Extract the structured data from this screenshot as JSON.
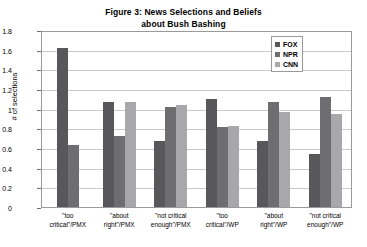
{
  "chart_data": {
    "type": "bar",
    "title": "Figure 3:  News Selections and Beliefs about Bush Bashing",
    "title_line1": "Figure 3:  News Selections and Beliefs",
    "title_line2": "about Bush Bashing",
    "xlabel": "",
    "ylabel": "# of selections",
    "ylim": [
      0,
      1.8
    ],
    "ytick_values": [
      "1.8",
      "1.6",
      "1.4",
      "1.2",
      "1",
      "0.8",
      "0.6",
      "0.4",
      "0.2",
      "0"
    ],
    "grid": true,
    "legend_position": "top-right",
    "categories": [
      "\"too critical\"/PMX",
      "\"about right\"/PMX",
      "\"not critical enough\"/PMX",
      "\"too critical\"/WP",
      "\"about right\"/WP",
      "\"not critical enough\"/WP"
    ],
    "category_lines": [
      [
        "\"too",
        "critical\"/PMX"
      ],
      [
        "\"about",
        "right\"/PMX"
      ],
      [
        "\"not critical",
        "enough\"/PMX"
      ],
      [
        "\"too",
        "critical\"/WP"
      ],
      [
        "\"about",
        "right\"/WP"
      ],
      [
        "\"not critical",
        "enough\"/WP"
      ]
    ],
    "series": [
      {
        "name": "FOX",
        "color": "#58585a",
        "values": [
          1.62,
          1.07,
          0.67,
          1.1,
          0.67,
          0.54
        ]
      },
      {
        "name": "NPR",
        "color": "#6e6e70",
        "values": [
          0.63,
          0.72,
          1.02,
          0.81,
          1.07,
          1.12
        ]
      },
      {
        "name": "CNN",
        "color": "#a8a8aa",
        "values": [
          null,
          1.07,
          1.04,
          0.82,
          0.97,
          0.95
        ]
      }
    ]
  },
  "legend": {
    "items": [
      {
        "label": "FOX",
        "color": "#58585a"
      },
      {
        "label": "NPR",
        "color": "#6e6e70"
      },
      {
        "label": "CNN",
        "color": "#a8a8aa"
      }
    ]
  }
}
